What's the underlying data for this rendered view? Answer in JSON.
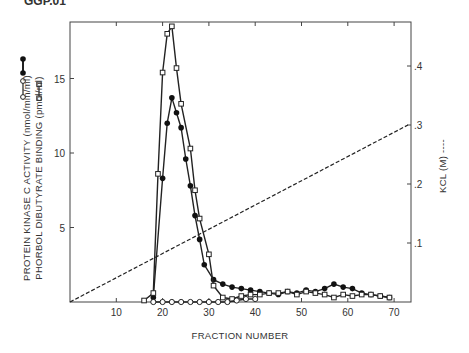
{
  "top_fragment": "GGP.01",
  "chart_data": {
    "type": "line",
    "title": "",
    "xlabel": "FRACTION NUMBER",
    "ylabel_left": "PROTEIN KINASE C ACTIVITY (nmol/min/ml) / PHORBOL DIBUTYRATE BINDING (pmol/ml)",
    "ylabel_left_lines": [
      "PROTEIN KINASE C ACTIVITY (nmol/min/ml)",
      "PHORBOL DIBUTYRATE BINDING (pmol/ml)"
    ],
    "ylabel_right": "KCL (M) ----",
    "xlim": [
      0,
      73
    ],
    "ylim_left": [
      0,
      19
    ],
    "ylim_right": [
      0,
      0.47
    ],
    "x_ticks": [
      10,
      20,
      30,
      40,
      50,
      60,
      70
    ],
    "y_ticks_left": [
      5,
      10,
      15
    ],
    "y_ticks_right": [
      ".1",
      ".2",
      ".3",
      ".4"
    ],
    "y_ticks_right_values": [
      0.1,
      0.2,
      0.3,
      0.4
    ],
    "grid": false,
    "legend": [
      {
        "marker": "filled-circle",
        "label": "PROTEIN KINASE C ACTIVITY"
      },
      {
        "marker": "open-circle",
        "label": "PHORBOL DIBUTYRATE BINDING"
      },
      {
        "marker": "open-square",
        "label": "PHORBOL DIBUTYRATE BINDING"
      }
    ],
    "series": [
      {
        "name": "Protein kinase C activity",
        "marker": "filled-circle",
        "axis": "left",
        "x": [
          18,
          20,
          21,
          22,
          23,
          24,
          25,
          26,
          27,
          28,
          29,
          31,
          33,
          35,
          37,
          39,
          41,
          43,
          45,
          47,
          49,
          51,
          53,
          55,
          57,
          59,
          61,
          63,
          65,
          67,
          69
        ],
        "y": [
          0.3,
          8.3,
          12.0,
          13.7,
          12.7,
          11.7,
          9.6,
          7.8,
          5.8,
          4.2,
          2.5,
          1.5,
          1.2,
          1.0,
          0.9,
          0.8,
          0.7,
          0.6,
          0.5,
          0.7,
          0.6,
          0.8,
          0.7,
          0.9,
          1.2,
          1.0,
          0.9,
          0.6,
          0.5,
          0.4,
          0.3
        ]
      },
      {
        "name": "Phorbol dibutyrate binding (squares)",
        "marker": "open-square",
        "axis": "left",
        "x": [
          16,
          18,
          19,
          20,
          21,
          22,
          23,
          24,
          26,
          27,
          28,
          30,
          31,
          33,
          35,
          37,
          39,
          41,
          43,
          45,
          47,
          49,
          51,
          53,
          55,
          57,
          59,
          61,
          63,
          65,
          67,
          69
        ],
        "y": [
          0.1,
          0.6,
          8.6,
          15.4,
          18.0,
          18.5,
          15.7,
          13.3,
          10.3,
          7.5,
          5.6,
          3.2,
          1.1,
          0.3,
          0.2,
          0.4,
          0.5,
          0.5,
          0.6,
          0.6,
          0.7,
          0.5,
          0.7,
          0.6,
          0.5,
          0.3,
          0.5,
          0.4,
          0.5,
          0.5,
          0.4,
          0.3
        ]
      },
      {
        "name": "Phorbol dibutyrate binding (circles)",
        "marker": "open-circle",
        "axis": "left",
        "x": [
          18,
          20,
          22,
          24,
          26,
          28,
          30,
          32,
          34,
          36,
          38,
          40
        ],
        "y": [
          0,
          0,
          0,
          0,
          0,
          0,
          0,
          0,
          0,
          0.1,
          0.2,
          0.2
        ]
      },
      {
        "name": "KCl gradient",
        "marker": "none",
        "line": "dashed",
        "axis": "right",
        "x": [
          0,
          73
        ],
        "y": [
          0,
          0.3
        ]
      }
    ]
  }
}
